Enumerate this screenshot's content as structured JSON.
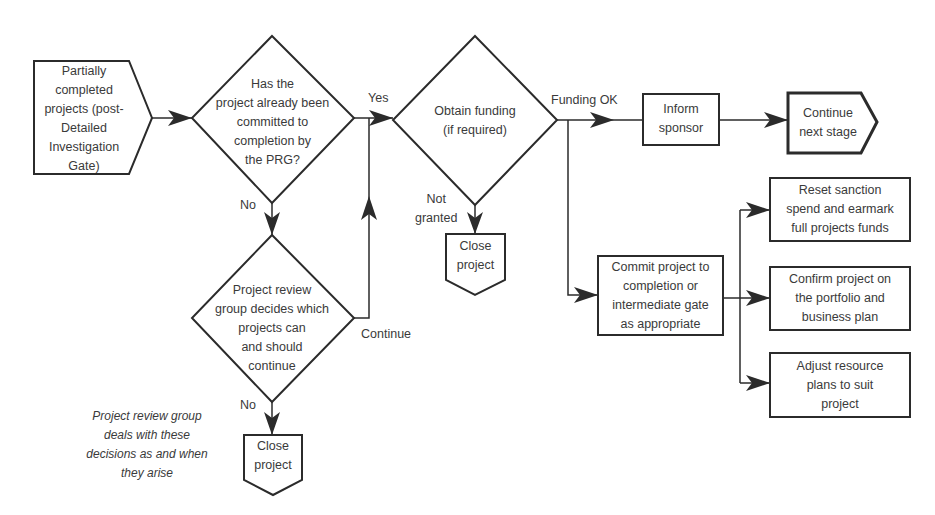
{
  "diagram": {
    "type": "flowchart",
    "nodes": {
      "start": {
        "shape": "pentagon-right",
        "label": "Partially\ncompleted\nprojects (post-\nDetailed\nInvestigation\nGate)"
      },
      "decision_committed": {
        "shape": "diamond",
        "label": "Has the\nproject already been\ncommitted to\ncompletion by\nthe PRG?"
      },
      "decision_funding": {
        "shape": "diamond",
        "label": "Obtain funding\n(if required)"
      },
      "decision_review": {
        "shape": "diamond",
        "label": "Project review\ngroup decides which\nprojects can\nand should\ncontinue"
      },
      "close_project_funding": {
        "shape": "pentagon-down",
        "label": "Close\nproject"
      },
      "close_project_review": {
        "shape": "pentagon-down",
        "label": "Close\nproject"
      },
      "inform_sponsor": {
        "shape": "rectangle",
        "label": "Inform\nsponsor"
      },
      "continue_next_stage": {
        "shape": "pentagon-right",
        "label": "Continue\nnext stage"
      },
      "commit_project": {
        "shape": "rectangle",
        "label": "Commit project to\ncompletion or\nintermediate gate\nas appropriate"
      },
      "reset_sanction": {
        "shape": "rectangle",
        "label": "Reset sanction\nspend and earmark\nfull projects funds"
      },
      "confirm_project": {
        "shape": "rectangle",
        "label": "Confirm project on\nthe portfolio and\nbusiness plan"
      },
      "adjust_resource": {
        "shape": "rectangle",
        "label": "Adjust resource\nplans to suit\nproject"
      }
    },
    "edge_labels": {
      "yes": "Yes",
      "no_committed": "No",
      "funding_ok": "Funding OK",
      "not_granted": "Not\ngranted",
      "continue": "Continue",
      "no_review": "No"
    },
    "note": "Project review group\ndeals with these\ndecisions as and when\nthey arise",
    "edges": [
      {
        "from": "start",
        "to": "decision_committed"
      },
      {
        "from": "decision_committed",
        "to": "decision_funding",
        "label": "Yes"
      },
      {
        "from": "decision_committed",
        "to": "decision_review",
        "label": "No"
      },
      {
        "from": "decision_review",
        "to": "decision_funding",
        "label": "Continue"
      },
      {
        "from": "decision_review",
        "to": "close_project_review",
        "label": "No"
      },
      {
        "from": "decision_funding",
        "to": "inform_sponsor",
        "label": "Funding OK"
      },
      {
        "from": "decision_funding",
        "to": "close_project_funding",
        "label": "Not granted"
      },
      {
        "from": "decision_funding",
        "to": "commit_project"
      },
      {
        "from": "inform_sponsor",
        "to": "continue_next_stage"
      },
      {
        "from": "commit_project",
        "to": "reset_sanction"
      },
      {
        "from": "commit_project",
        "to": "confirm_project"
      },
      {
        "from": "commit_project",
        "to": "adjust_resource"
      }
    ]
  }
}
